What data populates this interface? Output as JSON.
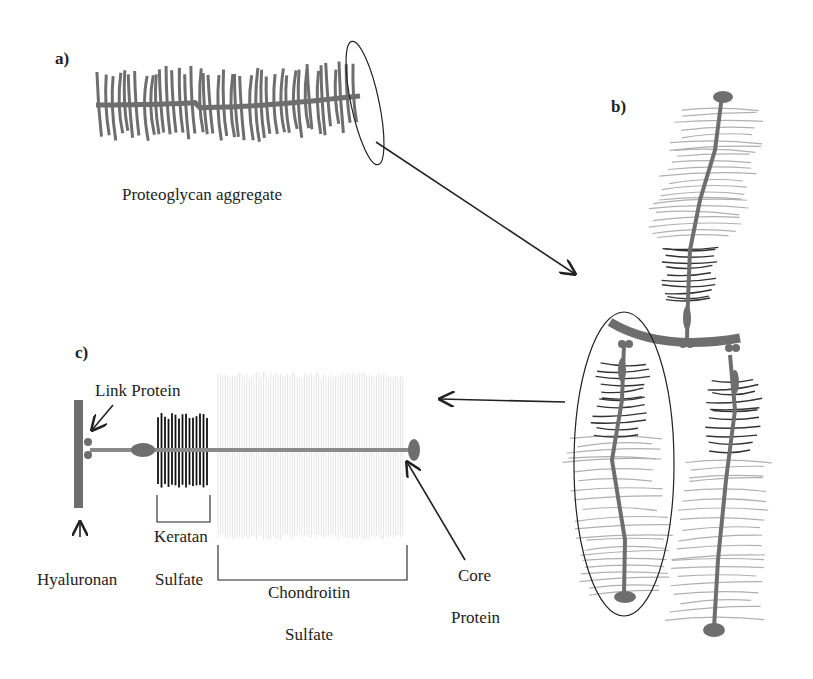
{
  "figure": {
    "panels": {
      "a": {
        "label": "a)",
        "caption": "Proteoglycan aggregate"
      },
      "b": {
        "label": "b)"
      },
      "c": {
        "label": "c)",
        "labels": {
          "link_protein": "Link Protein",
          "hyaluronan": "Hyaluronan",
          "keratan": "Keratan",
          "keratan_sulfate": "Sulfate",
          "chondroitin": "Chondroitin",
          "chondroitin_sulfate": "Sulfate",
          "core": "Core",
          "core_protein": "Protein"
        }
      }
    },
    "colors": {
      "core": "#6e6e6e",
      "gag_light": "#b0b0b0",
      "gag_dark": "#333333",
      "outline": "#222222"
    }
  }
}
